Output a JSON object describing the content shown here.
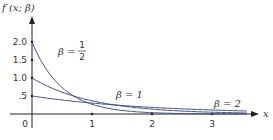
{
  "chart_data": {
    "type": "line",
    "title": "",
    "ylabel": "f (x; β)",
    "xlabel": "x",
    "xlim": [
      0,
      3.6
    ],
    "ylim": [
      0,
      2.0
    ],
    "grid": false,
    "x_ticks": [
      "1",
      "2",
      "3"
    ],
    "x_tick_values": [
      1,
      2,
      3
    ],
    "origin_label": "0",
    "y_ticks": [
      ".5",
      "1.0",
      "1.5",
      "2.0"
    ],
    "y_tick_values": [
      0.5,
      1.0,
      1.5,
      2.0
    ],
    "series": [
      {
        "name": "β = 1/2",
        "formula": "(1/β) e^(-x/β)",
        "beta": 0.5,
        "x": [
          0,
          0.25,
          0.5,
          0.75,
          1,
          1.5,
          2,
          2.5,
          3,
          3.5
        ],
        "values": [
          2.0,
          1.213,
          0.736,
          0.446,
          0.271,
          0.1,
          0.037,
          0.013,
          0.005,
          0.002
        ]
      },
      {
        "name": "β = 1",
        "formula": "(1/β) e^(-x/β)",
        "beta": 1,
        "x": [
          0,
          0.5,
          1,
          1.5,
          2,
          2.5,
          3,
          3.5
        ],
        "values": [
          1.0,
          0.607,
          0.368,
          0.223,
          0.135,
          0.082,
          0.05,
          0.03
        ]
      },
      {
        "name": "β = 2",
        "formula": "(1/β) e^(-x/β)",
        "beta": 2,
        "x": [
          0,
          0.5,
          1,
          1.5,
          2,
          2.5,
          3,
          3.5
        ],
        "values": [
          0.5,
          0.389,
          0.303,
          0.236,
          0.184,
          0.143,
          0.112,
          0.087
        ]
      }
    ],
    "annotations": [
      {
        "text": "β =",
        "fraction": {
          "num": "1",
          "den": "2"
        },
        "series": "β = 1/2"
      },
      {
        "text": "β = 1",
        "series": "β = 1"
      },
      {
        "text": "β = 2",
        "series": "β = 2"
      }
    ]
  },
  "labels": {
    "ylabel": "f (x; β)",
    "xlabel": "x",
    "origin": "0",
    "xt1": "1",
    "xt2": "2",
    "xt3": "3",
    "yt05": ".5",
    "yt10": "1.0",
    "yt15": "1.5",
    "yt20": "2.0",
    "beta_half_prefix": "β =",
    "beta_half_num": "1",
    "beta_half_den": "2",
    "beta_one": "β = 1",
    "beta_two": "β = 2"
  },
  "colors": {
    "curve": "#3a4a8c",
    "axis": "#222222",
    "text": "#333333"
  }
}
